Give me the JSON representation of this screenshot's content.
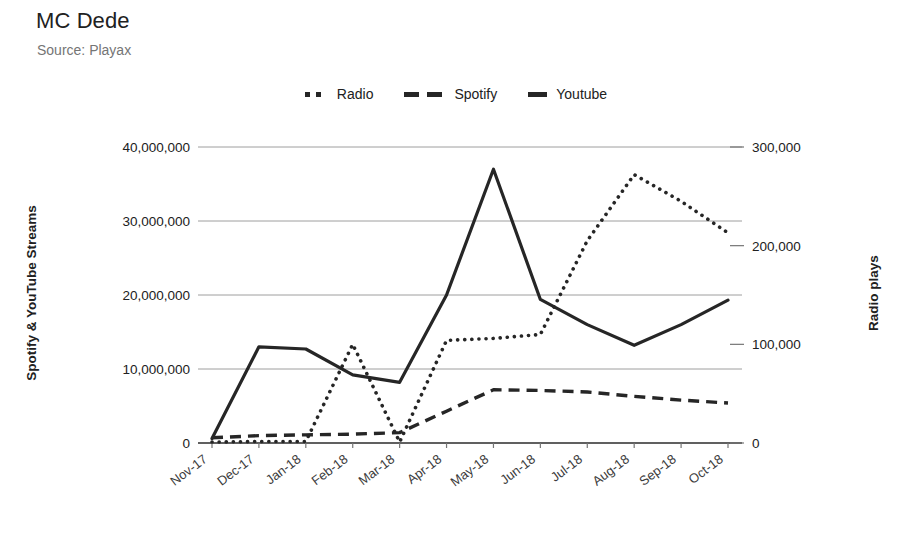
{
  "chart_data": {
    "type": "line",
    "title": "MC Dede",
    "subtitle": "Source: Playax",
    "xlabel": "",
    "ylabel": "Spotify & YouTube Streams",
    "y2label": "Radio plays",
    "grid": true,
    "legend_position": "top-center",
    "categories": [
      "Nov-17",
      "Dec-17",
      "Jan-18",
      "Feb-18",
      "Mar-18",
      "Apr-18",
      "May-18",
      "Jun-18",
      "Jul-18",
      "Aug-18",
      "Sep-18",
      "Oct-18"
    ],
    "left_axis": {
      "label": "Spotify & YouTube Streams",
      "ylim": [
        0,
        40000000
      ],
      "ticks": [
        0,
        10000000,
        20000000,
        30000000,
        40000000
      ],
      "tick_labels": [
        "0",
        "10,000,000",
        "20,000,000",
        "30,000,000",
        "40,000,000"
      ]
    },
    "right_axis": {
      "label": "Radio plays",
      "ylim": [
        0,
        300000
      ],
      "ticks": [
        0,
        100000,
        200000,
        300000
      ],
      "tick_labels": [
        "0",
        "100,000",
        "200,000",
        "300,000"
      ]
    },
    "series": [
      {
        "name": "Radio",
        "axis": "right",
        "style": "dotted",
        "color": "#262626",
        "values": [
          1000,
          1500,
          1500,
          100000,
          1000,
          104000,
          106000,
          110000,
          205000,
          272000,
          245000,
          213000
        ]
      },
      {
        "name": "Spotify",
        "axis": "left",
        "style": "dashed",
        "color": "#262626",
        "values": [
          700000,
          1000000,
          1100000,
          1200000,
          1400000,
          4300000,
          7200000,
          7100000,
          6900000,
          6300000,
          5800000,
          5400000
        ]
      },
      {
        "name": "Youtube",
        "axis": "left",
        "style": "solid",
        "color": "#262626",
        "values": [
          600000,
          13000000,
          12700000,
          9200000,
          8200000,
          20000000,
          37000000,
          19400000,
          16000000,
          13200000,
          16000000,
          19300000
        ]
      }
    ]
  },
  "legend": {
    "items": [
      {
        "label": "Radio",
        "marker": "dotted-line-swatch"
      },
      {
        "label": "Spotify",
        "marker": "dashed-line-swatch"
      },
      {
        "label": "Youtube",
        "marker": "solid-line-swatch"
      }
    ]
  }
}
